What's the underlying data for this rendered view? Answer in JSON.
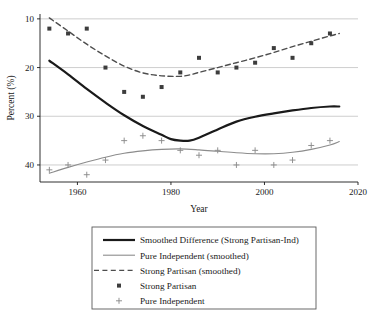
{
  "chart_data": {
    "type": "scatter",
    "title": "",
    "xlabel": "Year",
    "ylabel": "Percent (%)",
    "xlim": [
      1952,
      2020
    ],
    "ylim": [
      6.5,
      41
    ],
    "xticks": [
      1960,
      1980,
      2000,
      2020
    ],
    "yticks": [
      10,
      20,
      30,
      40
    ],
    "grid": true,
    "grid_axis": "y",
    "legend_position": "below-plot",
    "series": [
      {
        "name": "Smoothed Difference (Strong Partisan-Ind)",
        "type": "line",
        "style": "solid",
        "color": "#1a1a1a",
        "width": 2.2,
        "x": [
          1954,
          1958,
          1962,
          1966,
          1970,
          1974,
          1978,
          1980,
          1982,
          1984,
          1986,
          1990,
          1994,
          1998,
          2002,
          2006,
          2010,
          2014,
          2016
        ],
        "y": [
          31.4,
          28.6,
          25.6,
          22.8,
          20.2,
          18.0,
          16.2,
          15.3,
          15.0,
          15.0,
          15.6,
          17.3,
          18.9,
          19.9,
          20.6,
          21.2,
          21.7,
          22.0,
          22.0
        ]
      },
      {
        "name": "Pure Independent (smoothed)",
        "type": "line",
        "style": "solid",
        "color": "#8c8c8c",
        "width": 1.1,
        "x": [
          1954,
          1958,
          1962,
          1966,
          1970,
          1974,
          1978,
          1982,
          1986,
          1990,
          1994,
          1998,
          2002,
          2006,
          2010,
          2014,
          2016
        ],
        "y": [
          8.3,
          9.5,
          10.6,
          11.6,
          12.4,
          12.9,
          13.2,
          13.3,
          13.1,
          12.8,
          12.5,
          12.3,
          12.3,
          12.6,
          13.2,
          14.1,
          14.8
        ]
      },
      {
        "name": "Strong Partisan (smoothed)",
        "type": "line",
        "style": "dashed",
        "color": "#4d4d4d",
        "width": 1.4,
        "x": [
          1954,
          1958,
          1962,
          1966,
          1970,
          1974,
          1978,
          1982,
          1984,
          1986,
          1990,
          1994,
          1998,
          2002,
          2006,
          2010,
          2014,
          2016
        ],
        "y": [
          40.2,
          37.5,
          34.8,
          32.4,
          30.3,
          28.9,
          28.3,
          28.2,
          28.5,
          29.0,
          30.0,
          31.0,
          32.0,
          33.1,
          34.3,
          35.4,
          36.5,
          37.0
        ]
      },
      {
        "name": "Strong Partisan",
        "type": "scatter",
        "marker": "square",
        "color": "#3d3d3d",
        "x": [
          1954,
          1958,
          1962,
          1966,
          1970,
          1974,
          1978,
          1982,
          1986,
          1990,
          1994,
          1998,
          2002,
          2006,
          2010,
          2014
        ],
        "y": [
          38,
          37,
          38,
          30,
          25,
          24,
          26,
          29,
          32,
          29,
          30,
          31,
          34,
          32,
          35,
          37
        ]
      },
      {
        "name": "Pure Independent",
        "type": "scatter",
        "marker": "plus",
        "color": "#8c8c8c",
        "x": [
          1954,
          1958,
          1962,
          1966,
          1970,
          1974,
          1978,
          1982,
          1986,
          1990,
          1994,
          1998,
          2002,
          2006,
          2010,
          2014
        ],
        "y": [
          9,
          10,
          8,
          11,
          15,
          16,
          15,
          13,
          12,
          13,
          10,
          13,
          10,
          11,
          14,
          15
        ]
      }
    ]
  },
  "axes": {
    "ylabel": "Percent (%)",
    "xlabel": "Year",
    "ytick_labels": [
      "40",
      "30",
      "20",
      "10"
    ],
    "xtick_labels": [
      "1960",
      "1980",
      "2000",
      "2020"
    ]
  },
  "legend": {
    "items": [
      {
        "label": "Smoothed Difference (Strong Partisan-Ind)",
        "key": "solid-thick-black"
      },
      {
        "label": "Pure Independent (smoothed)",
        "key": "solid-thin-gray"
      },
      {
        "label": "Strong Partisan (smoothed)",
        "key": "dashed-gray"
      },
      {
        "label": "Strong Partisan",
        "key": "square-marker"
      },
      {
        "label": "Pure Independent",
        "key": "plus-marker"
      }
    ]
  }
}
